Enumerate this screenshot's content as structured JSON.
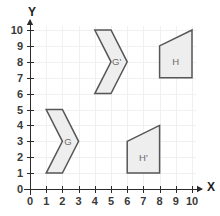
{
  "chart_data": {
    "type": "scatter",
    "title": "",
    "xlabel": "X",
    "ylabel": "Y",
    "xlim": [
      0,
      10
    ],
    "ylim": [
      0,
      10
    ],
    "grid": true,
    "legend": "none",
    "x_ticks": [
      "0",
      "1",
      "2",
      "3",
      "4",
      "5",
      "6",
      "7",
      "8",
      "9",
      "10"
    ],
    "y_ticks": [
      "0",
      "1",
      "2",
      "3",
      "4",
      "5",
      "6",
      "7",
      "8",
      "9",
      "10"
    ],
    "shapes": [
      {
        "label": "G",
        "kind": "chevron",
        "vertices": [
          [
            1,
            5
          ],
          [
            2,
            5
          ],
          [
            3,
            3
          ],
          [
            2,
            1
          ],
          [
            1,
            1
          ],
          [
            2,
            3
          ]
        ],
        "label_at": [
          2.35,
          3.0
        ],
        "fill": "#eeeeee",
        "stroke": "#565656"
      },
      {
        "label": "G'",
        "kind": "chevron",
        "vertices": [
          [
            4,
            10
          ],
          [
            5,
            10
          ],
          [
            6,
            8
          ],
          [
            5,
            6
          ],
          [
            4,
            6
          ],
          [
            5,
            8
          ]
        ],
        "label_at": [
          5.35,
          8.0
        ],
        "fill": "#eeeeee",
        "stroke": "#565656"
      },
      {
        "label": "H",
        "kind": "trapezoid",
        "vertices": [
          [
            8,
            9
          ],
          [
            10,
            10
          ],
          [
            10,
            7
          ],
          [
            8,
            7
          ]
        ],
        "label_at": [
          9.0,
          8.0
        ],
        "fill": "#eeeeee",
        "stroke": "#565656"
      },
      {
        "label": "H'",
        "kind": "trapezoid",
        "vertices": [
          [
            6,
            3
          ],
          [
            8,
            4
          ],
          [
            8,
            1
          ],
          [
            6,
            1
          ]
        ],
        "label_at": [
          7.0,
          2.0
        ],
        "fill": "#eeeeee",
        "stroke": "#565656"
      }
    ],
    "colors": {
      "background": "#ffffff",
      "grid": "#eff0f1",
      "axis": "#2b2b2b",
      "shape_fill": "#eeeeee",
      "shape_stroke": "#565656",
      "tick_text": "#3a3a3a",
      "shape_label": "#6b6b6b"
    }
  }
}
